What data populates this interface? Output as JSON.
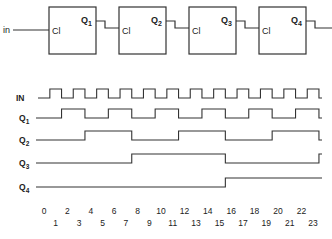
{
  "circuit": {
    "input_label": "in",
    "flip_flops": [
      {
        "clock_label": "Cl",
        "output_label": "Q",
        "output_sub": "1"
      },
      {
        "clock_label": "Cl",
        "output_label": "Q",
        "output_sub": "2"
      },
      {
        "clock_label": "Cl",
        "output_label": "Q",
        "output_sub": "3"
      },
      {
        "clock_label": "Cl",
        "output_label": "Q",
        "output_sub": "4"
      }
    ]
  },
  "timing": {
    "signals": [
      {
        "label": "IN",
        "sub": "",
        "edges": [
          0.5,
          1.5,
          2.5,
          3.5,
          4.5,
          5.5,
          6.5,
          7.5,
          8.5,
          9.5,
          10.5,
          11.5,
          12.5,
          13.5,
          14.5,
          15.5,
          16.5,
          17.5,
          18.5,
          19.5,
          20.5,
          21.5,
          22.5,
          23.5
        ]
      },
      {
        "label": "Q",
        "sub": "1",
        "edges": [
          1.5,
          3.5,
          5.5,
          7.5,
          9.5,
          11.5,
          13.5,
          15.5,
          17.5,
          19.5,
          21.5,
          23.5
        ]
      },
      {
        "label": "Q",
        "sub": "2",
        "edges": [
          3.5,
          7.5,
          11.5,
          15.5,
          19.5,
          23.5
        ]
      },
      {
        "label": "Q",
        "sub": "3",
        "edges": [
          7.5,
          15.5,
          23.5
        ]
      },
      {
        "label": "Q",
        "sub": "4",
        "edges": [
          15.5
        ]
      }
    ],
    "ticks_even": [
      "0",
      "2",
      "4",
      "6",
      "8",
      "10",
      "12",
      "14",
      "16",
      "18",
      "20",
      "22"
    ],
    "ticks_odd": [
      "1",
      "3",
      "5",
      "7",
      "9",
      "11",
      "13",
      "15",
      "17",
      "19",
      "21",
      "23"
    ]
  }
}
